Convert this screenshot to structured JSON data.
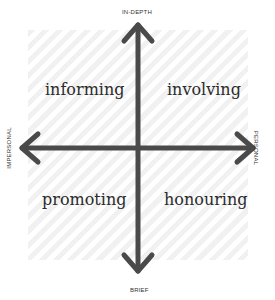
{
  "axes": {
    "top": "IN-DEPTH",
    "bottom": "BRIEF",
    "left": "IMPERSONAL",
    "right": "PERSONAL"
  },
  "quadrants": {
    "top_left": "informing",
    "top_right": "involving",
    "bottom_left": "promoting",
    "bottom_right": "honouring"
  },
  "colors": {
    "axis": "#4a4a4a",
    "hatch": "#f1f1f1",
    "text": "#2b2b2b"
  }
}
